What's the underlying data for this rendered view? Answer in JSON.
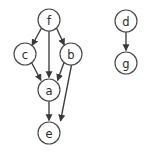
{
  "graph": {
    "title": "Directed Graph",
    "type": "directed-acyclic-graph",
    "background_color": "#ffffff",
    "node_stroke_color": "#474747",
    "node_fill_color": "#ffffff",
    "edge_color": "#3a3a3a",
    "label_color": "#2b2b2b",
    "node_radius": 11,
    "nodes": [
      {
        "id": "f",
        "label": "f",
        "cx": 49,
        "cy": 20
      },
      {
        "id": "c",
        "label": "c",
        "cx": 25,
        "cy": 54
      },
      {
        "id": "b",
        "label": "b",
        "cx": 71,
        "cy": 54
      },
      {
        "id": "a",
        "label": "a",
        "cx": 49,
        "cy": 90
      },
      {
        "id": "e",
        "label": "e",
        "cx": 49,
        "cy": 133
      },
      {
        "id": "d",
        "label": "d",
        "cx": 126,
        "cy": 21
      },
      {
        "id": "g",
        "label": "g",
        "cx": 126,
        "cy": 63
      }
    ],
    "edges": [
      {
        "from": "f",
        "to": "c",
        "directed": true
      },
      {
        "from": "f",
        "to": "b",
        "directed": true
      },
      {
        "from": "f",
        "to": "a",
        "directed": true
      },
      {
        "from": "c",
        "to": "a",
        "directed": true
      },
      {
        "from": "b",
        "to": "a",
        "directed": true
      },
      {
        "from": "b",
        "to": "e",
        "directed": true
      },
      {
        "from": "a",
        "to": "e",
        "directed": true
      },
      {
        "from": "d",
        "to": "g",
        "directed": true
      }
    ],
    "components": [
      {
        "name": "main-component",
        "members": [
          "f",
          "c",
          "b",
          "a",
          "e"
        ]
      },
      {
        "name": "secondary-component",
        "members": [
          "d",
          "g"
        ]
      }
    ]
  }
}
